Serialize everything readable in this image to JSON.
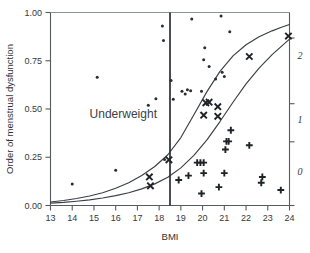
{
  "chart_data": {
    "type": "scatter",
    "title": "",
    "subtitle": "",
    "xlabel": "BMI",
    "ylabel": "Order of menstrual dysfunction",
    "ylabel_right": "",
    "xlim": [
      13,
      24
    ],
    "ylim": [
      0.0,
      1.0
    ],
    "xticks": [
      13,
      14,
      15,
      16,
      17,
      18,
      19,
      20,
      21,
      22,
      23,
      24
    ],
    "xticklabels": [
      "13",
      "14",
      "15",
      "16",
      "17",
      "18",
      "19",
      "20",
      "21",
      "22",
      "23",
      "24"
    ],
    "yticks": [
      0.0,
      0.25,
      0.5,
      0.75,
      1.0
    ],
    "yticklabels": [
      "0.00",
      "0.25",
      "0.50",
      "0.75",
      "1.00"
    ],
    "right_axis": {
      "ticks": [
        0.0,
        0.33,
        0.64,
        0.9
      ],
      "labels": [
        "0",
        "1",
        "2"
      ],
      "label_values": [
        0.19,
        0.45,
        0.79
      ],
      "italic": true
    },
    "grid": false,
    "legend": "none",
    "annotations": [
      {
        "text": "Underweight",
        "x": 16.35,
        "y": 0.455,
        "type": "text-label"
      },
      {
        "text": "",
        "type": "vertical-threshold-line",
        "x": 18.5,
        "y_from": 0.0,
        "y_to": 1.0
      }
    ],
    "curves": [
      {
        "name": "upper-fitted-curve",
        "x": [
          13.0,
          13.6,
          14.2,
          14.8,
          15.4,
          16.0,
          16.6,
          17.2,
          17.8,
          18.4,
          19.0,
          19.6,
          20.2,
          20.8,
          21.4,
          22.0,
          22.6,
          23.2,
          23.6,
          24.0
        ],
        "y": [
          0.018,
          0.026,
          0.036,
          0.049,
          0.066,
          0.089,
          0.118,
          0.155,
          0.202,
          0.263,
          0.352,
          0.47,
          0.59,
          0.695,
          0.775,
          0.833,
          0.874,
          0.905,
          0.922,
          0.938
        ]
      },
      {
        "name": "lower-fitted-curve",
        "x": [
          13.0,
          13.6,
          14.2,
          14.8,
          15.4,
          16.0,
          16.6,
          17.2,
          17.8,
          18.4,
          19.0,
          19.6,
          20.2,
          20.8,
          21.4,
          22.0,
          22.6,
          23.2,
          23.6,
          24.0
        ],
        "y": [
          0.012,
          0.016,
          0.022,
          0.029,
          0.039,
          0.051,
          0.066,
          0.086,
          0.112,
          0.146,
          0.195,
          0.26,
          0.34,
          0.435,
          0.535,
          0.63,
          0.712,
          0.782,
          0.822,
          0.862
        ]
      }
    ],
    "series": [
      {
        "name": "dot-observations",
        "marker": "dot",
        "points": [
          {
            "x": 14.0,
            "y": 0.112
          },
          {
            "x": 15.15,
            "y": 0.665
          },
          {
            "x": 16.0,
            "y": 0.183
          },
          {
            "x": 17.5,
            "y": 0.52
          },
          {
            "x": 17.85,
            "y": 0.553
          },
          {
            "x": 18.15,
            "y": 0.93
          },
          {
            "x": 18.2,
            "y": 0.855
          },
          {
            "x": 18.25,
            "y": 0.238
          },
          {
            "x": 18.55,
            "y": 0.648
          },
          {
            "x": 18.65,
            "y": 0.55
          },
          {
            "x": 19.05,
            "y": 0.592
          },
          {
            "x": 19.2,
            "y": 0.578
          },
          {
            "x": 19.3,
            "y": 0.6
          },
          {
            "x": 19.45,
            "y": 0.595
          },
          {
            "x": 19.5,
            "y": 0.966
          },
          {
            "x": 19.95,
            "y": 0.592
          },
          {
            "x": 20.05,
            "y": 0.755
          },
          {
            "x": 20.1,
            "y": 0.818
          },
          {
            "x": 20.3,
            "y": 0.72
          },
          {
            "x": 20.85,
            "y": 0.982
          },
          {
            "x": 20.9,
            "y": 0.69
          },
          {
            "x": 21.0,
            "y": 0.668
          },
          {
            "x": 21.25,
            "y": 0.9
          },
          {
            "x": 20.6,
            "y": 0.655
          }
        ]
      },
      {
        "name": "cross-observations",
        "marker": "x",
        "points": [
          {
            "x": 17.55,
            "y": 0.148
          },
          {
            "x": 17.6,
            "y": 0.102
          },
          {
            "x": 18.45,
            "y": 0.237
          },
          {
            "x": 20.15,
            "y": 0.532
          },
          {
            "x": 20.3,
            "y": 0.535
          },
          {
            "x": 20.05,
            "y": 0.468
          },
          {
            "x": 20.7,
            "y": 0.512
          },
          {
            "x": 20.7,
            "y": 0.462
          },
          {
            "x": 22.15,
            "y": 0.772
          },
          {
            "x": 23.95,
            "y": 0.878
          }
        ]
      },
      {
        "name": "plus-observations",
        "marker": "+",
        "points": [
          {
            "x": 18.9,
            "y": 0.132
          },
          {
            "x": 19.35,
            "y": 0.155
          },
          {
            "x": 19.75,
            "y": 0.222
          },
          {
            "x": 19.9,
            "y": 0.222
          },
          {
            "x": 20.05,
            "y": 0.222
          },
          {
            "x": 20.05,
            "y": 0.168
          },
          {
            "x": 19.95,
            "y": 0.062
          },
          {
            "x": 20.75,
            "y": 0.095
          },
          {
            "x": 21.0,
            "y": 0.168
          },
          {
            "x": 21.1,
            "y": 0.332
          },
          {
            "x": 21.2,
            "y": 0.332
          },
          {
            "x": 21.05,
            "y": 0.29
          },
          {
            "x": 21.3,
            "y": 0.39
          },
          {
            "x": 22.15,
            "y": 0.312
          },
          {
            "x": 22.75,
            "y": 0.148
          },
          {
            "x": 22.7,
            "y": 0.118
          },
          {
            "x": 23.6,
            "y": 0.08
          }
        ]
      }
    ]
  },
  "axes": {
    "x_title": "BMI",
    "y_title": "Order of menstrual dysfunction"
  }
}
